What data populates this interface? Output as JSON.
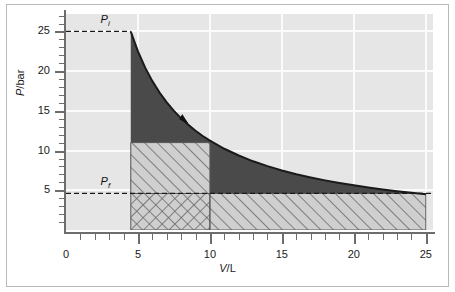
{
  "chart_data": {
    "type": "line",
    "title": "",
    "xlabel": "V/L",
    "ylabel": "P/bar",
    "xlim": [
      0,
      25.5
    ],
    "ylim": [
      0,
      27.2
    ],
    "grid": true,
    "legend": null,
    "x_ticks": [
      0,
      5,
      10,
      15,
      20,
      25
    ],
    "x_tick_labels": [
      "0",
      "5",
      "10",
      "15",
      "20",
      "25"
    ],
    "x_minor_step": 1,
    "y_ticks": [
      5,
      10,
      15,
      20,
      25
    ],
    "y_tick_labels": [
      "5",
      "10",
      "15",
      "20",
      "25"
    ],
    "y_minor_step": 1,
    "series": [
      {
        "name": "isotherm PV = 112.5 bar L",
        "type": "line",
        "color": "#1a1a1a",
        "x": [
          4.5,
          5.0,
          5.5,
          6.0,
          6.5,
          7.0,
          7.5,
          8.0,
          8.5,
          9.0,
          9.5,
          10.0,
          11.0,
          12.0,
          13.0,
          14.0,
          15.0,
          16.0,
          17.0,
          18.0,
          19.0,
          20.0,
          21.0,
          22.0,
          23.0,
          24.0,
          25.0
        ],
        "y": [
          25.0,
          22.5,
          20.45,
          18.75,
          17.31,
          16.07,
          15.0,
          14.06,
          13.24,
          12.5,
          11.84,
          11.25,
          10.23,
          9.38,
          8.65,
          8.04,
          7.5,
          7.03,
          6.62,
          6.25,
          5.92,
          5.63,
          5.36,
          5.11,
          4.89,
          4.69,
          4.5
        ]
      }
    ],
    "annotations": [
      {
        "name": "pi-label",
        "text": "Pi",
        "symbol": "P",
        "subscript": "i",
        "value": 25.0,
        "x": 2.4,
        "kind": "dashed-level"
      },
      {
        "name": "pf-label",
        "text": "Pf",
        "symbol": "P",
        "subscript": "f",
        "value": 4.6,
        "x": 2.4,
        "kind": "dashed-level"
      },
      {
        "name": "direction-arrow",
        "text": "",
        "x": 8.2,
        "y": 13.7,
        "kind": "arrow-marker"
      }
    ],
    "regions": [
      {
        "name": "area-under-curve-dark",
        "fill": "#4a4a4a",
        "x_from": 4.5,
        "x_to": 25.0,
        "y_from": 4.6,
        "y_to": "curve",
        "pattern": "solid"
      },
      {
        "name": "reversible-work-hatch-left",
        "fill": "#cfcfcf",
        "x_from": 4.5,
        "x_to": 10.0,
        "y_from": 4.6,
        "y_to": 11.0,
        "pattern": "diagonal"
      },
      {
        "name": "irreversible-work-hatch-right",
        "fill": "#cfcfcf",
        "x_from": 10.0,
        "x_to": 25.0,
        "y_from": 0.0,
        "y_to": 4.6,
        "pattern": "diagonal"
      },
      {
        "name": "overlap-crosshatch",
        "fill": "#cfcfcf",
        "x_from": 4.5,
        "x_to": 10.0,
        "y_from": 0.0,
        "y_to": 4.6,
        "pattern": "crosshatch"
      }
    ],
    "colors": {
      "plot_background": "#e6e6e6",
      "gridline": "#fbfbfb",
      "dark_fill": "#4a4a4a",
      "hatch_fill": "#cfcfcf",
      "hatch_line": "#6a6a6a",
      "curve": "#1a1a1a",
      "axis": "#6d6d6d",
      "frame": "#b9b9b9",
      "text": "#1a1a1a"
    }
  },
  "axis_titles": {
    "y_symbol": "P",
    "y_unit": "/bar",
    "x_symbol": "V",
    "x_unit": "/L"
  },
  "labels": {
    "pi_symbol": "P",
    "pi_sub": "i",
    "pf_symbol": "P",
    "pf_sub": "f"
  }
}
